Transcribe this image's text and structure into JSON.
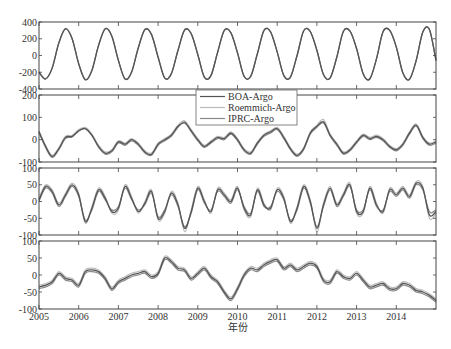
{
  "chart_data": [
    {
      "type": "line",
      "panel": 1,
      "title": "",
      "xlabel": "",
      "ylabel": "",
      "ylim": [
        -400,
        400
      ],
      "yticks": [
        -400,
        -200,
        0,
        200,
        400
      ],
      "grid": false,
      "x_start": 2005.0,
      "x_step_years": 0.16667,
      "series": [
        {
          "name": "BOA-Argo",
          "values": [
            -200,
            -280,
            -150,
            150,
            320,
            200,
            -100,
            -290,
            -180,
            120,
            320,
            230,
            -60,
            -280,
            -200,
            90,
            310,
            250,
            -20,
            -270,
            -220,
            60,
            305,
            260,
            10,
            -260,
            -240,
            40,
            300,
            270,
            30,
            -250,
            -250,
            20,
            300,
            280,
            40,
            -240,
            -260,
            0,
            295,
            285,
            60,
            -230,
            -270,
            -20,
            290,
            290,
            80,
            -220,
            -280,
            -40,
            285,
            300,
            100,
            -210,
            -285,
            -60,
            280,
            310,
            -60
          ]
        },
        {
          "name": "Roemmich-Argo",
          "values": [
            -195,
            -275,
            -145,
            155,
            322,
            205,
            -95,
            -287,
            -175,
            125,
            322,
            235,
            -55,
            -277,
            -195,
            95,
            312,
            254,
            -15,
            -267,
            -215,
            65,
            307,
            264,
            15,
            -257,
            -235,
            45,
            302,
            274,
            35,
            -247,
            -245,
            25,
            302,
            284,
            45,
            -237,
            -255,
            5,
            297,
            289,
            65,
            -227,
            -265,
            -15,
            292,
            294,
            85,
            -217,
            -275,
            -35,
            287,
            304,
            105,
            -207,
            -280,
            -55,
            282,
            314,
            -55
          ]
        },
        {
          "name": "IPRC-Argo",
          "values": [
            -198,
            -278,
            -148,
            152,
            318,
            202,
            -98,
            -288,
            -178,
            122,
            318,
            232,
            -58,
            -278,
            -198,
            92,
            308,
            252,
            -18,
            -268,
            -218,
            62,
            303,
            262,
            12,
            -258,
            -238,
            42,
            298,
            272,
            32,
            -248,
            -248,
            22,
            298,
            282,
            42,
            -238,
            -258,
            2,
            293,
            287,
            62,
            -228,
            -268,
            -18,
            288,
            292,
            82,
            -218,
            -278,
            -38,
            283,
            302,
            102,
            -208,
            -283,
            -58,
            278,
            312,
            -58
          ]
        }
      ],
      "legend": {
        "position": "upper center (overlapping panel 1/2 boundary)",
        "entries": [
          "BOA-Argo",
          "Roemmich-Argo",
          "IPRC-Argo"
        ]
      }
    },
    {
      "type": "line",
      "panel": 2,
      "ylim": [
        -100,
        200
      ],
      "yticks": [
        -100,
        0,
        100,
        200
      ],
      "x_start": 2005.0,
      "x_step_years": 0.16667,
      "series": [
        {
          "name": "BOA-Argo",
          "values": [
            35,
            -30,
            -75,
            -40,
            10,
            15,
            40,
            50,
            20,
            -30,
            -60,
            -50,
            -10,
            -20,
            0,
            -20,
            -55,
            -65,
            -20,
            0,
            20,
            60,
            75,
            40,
            0,
            -30,
            -10,
            10,
            5,
            30,
            0,
            -45,
            -60,
            -15,
            20,
            35,
            50,
            10,
            -40,
            -70,
            -40,
            30,
            60,
            80,
            20,
            -20,
            -60,
            -45,
            -10,
            20,
            5,
            15,
            0,
            -30,
            -45,
            -20,
            30,
            65,
            10,
            -20,
            -10
          ]
        },
        {
          "name": "Roemmich-Argo",
          "values": [
            40,
            -25,
            -70,
            -35,
            15,
            20,
            45,
            55,
            25,
            -25,
            -55,
            -45,
            -5,
            -15,
            5,
            -15,
            -50,
            -60,
            -15,
            5,
            25,
            65,
            85,
            45,
            5,
            -25,
            -5,
            15,
            10,
            35,
            5,
            -40,
            -55,
            -10,
            25,
            40,
            55,
            15,
            -35,
            -65,
            -35,
            35,
            65,
            90,
            25,
            -15,
            -55,
            -40,
            -5,
            25,
            10,
            20,
            5,
            -25,
            -40,
            -15,
            35,
            70,
            15,
            -15,
            -5
          ]
        },
        {
          "name": "IPRC-Argo",
          "values": [
            32,
            -35,
            -80,
            -45,
            5,
            12,
            38,
            48,
            18,
            -35,
            -65,
            -55,
            -15,
            -25,
            -5,
            -25,
            -60,
            -70,
            -25,
            -5,
            15,
            55,
            80,
            35,
            -5,
            -35,
            -15,
            5,
            0,
            25,
            -5,
            -50,
            -65,
            -20,
            15,
            30,
            45,
            5,
            -45,
            -75,
            -45,
            25,
            55,
            75,
            15,
            -25,
            -65,
            -50,
            -15,
            15,
            0,
            10,
            -5,
            -35,
            -50,
            -25,
            25,
            60,
            5,
            -25,
            -15
          ]
        }
      ]
    },
    {
      "type": "line",
      "panel": 3,
      "ylim": [
        -100,
        100
      ],
      "yticks": [
        -100,
        -50,
        0,
        50,
        100
      ],
      "x_start": 2005.0,
      "x_step_years": 0.16667,
      "series": [
        {
          "name": "BOA-Argo",
          "values": [
            5,
            45,
            30,
            -10,
            20,
            50,
            20,
            -60,
            -20,
            35,
            10,
            -30,
            -20,
            45,
            10,
            -30,
            -5,
            30,
            -50,
            -30,
            25,
            -10,
            -80,
            -30,
            40,
            0,
            -30,
            35,
            20,
            0,
            40,
            -20,
            -40,
            35,
            -10,
            -20,
            35,
            10,
            -60,
            -20,
            45,
            0,
            -80,
            -10,
            40,
            -10,
            20,
            50,
            -30,
            -30,
            40,
            -10,
            -30,
            35,
            20,
            40,
            15,
            55,
            40,
            -40,
            -30
          ]
        },
        {
          "name": "Roemmich-Argo",
          "values": [
            10,
            50,
            35,
            -5,
            25,
            55,
            25,
            -65,
            -15,
            40,
            15,
            -35,
            -25,
            50,
            15,
            -35,
            0,
            35,
            -55,
            -35,
            30,
            -5,
            -90,
            -25,
            45,
            5,
            -35,
            40,
            25,
            5,
            45,
            -25,
            -45,
            40,
            -5,
            -25,
            40,
            15,
            -65,
            -15,
            50,
            5,
            -90,
            -5,
            45,
            -5,
            25,
            55,
            -35,
            -35,
            45,
            -5,
            -35,
            40,
            25,
            45,
            20,
            60,
            45,
            -50,
            -35
          ]
        },
        {
          "name": "IPRC-Argo",
          "values": [
            0,
            40,
            25,
            -15,
            15,
            45,
            15,
            -55,
            -25,
            30,
            5,
            -25,
            -15,
            40,
            5,
            -25,
            -10,
            25,
            -45,
            -25,
            20,
            -15,
            -75,
            -35,
            35,
            -5,
            -25,
            30,
            15,
            -5,
            35,
            -15,
            -35,
            30,
            -15,
            -15,
            30,
            5,
            -55,
            -25,
            40,
            -5,
            -75,
            -15,
            35,
            -15,
            15,
            45,
            -25,
            -25,
            35,
            -15,
            -25,
            30,
            15,
            35,
            10,
            50,
            35,
            -30,
            -25
          ]
        }
      ]
    },
    {
      "type": "line",
      "panel": 4,
      "ylim": [
        -100,
        100
      ],
      "yticks": [
        -100,
        -50,
        0,
        50,
        100
      ],
      "x_start": 2005.0,
      "x_step_years": 0.16667,
      "series": [
        {
          "name": "BOA-Argo",
          "values": [
            -35,
            -30,
            -20,
            5,
            -10,
            -15,
            -30,
            10,
            15,
            10,
            -10,
            -40,
            -20,
            -10,
            0,
            5,
            10,
            -5,
            5,
            50,
            40,
            20,
            15,
            -10,
            5,
            20,
            -5,
            -20,
            -50,
            -70,
            -40,
            0,
            20,
            15,
            30,
            40,
            45,
            20,
            30,
            15,
            25,
            35,
            25,
            -15,
            -20,
            10,
            -5,
            -10,
            5,
            -15,
            -35,
            -30,
            -25,
            -40,
            -40,
            -25,
            -30,
            -45,
            -50,
            -60,
            -75
          ]
        },
        {
          "name": "Roemmich-Argo",
          "values": [
            -30,
            -25,
            -15,
            10,
            -5,
            -10,
            -25,
            15,
            20,
            15,
            -5,
            -35,
            -15,
            -5,
            5,
            10,
            15,
            0,
            10,
            55,
            45,
            25,
            20,
            -5,
            10,
            25,
            0,
            -15,
            -45,
            -65,
            -35,
            5,
            25,
            20,
            35,
            45,
            50,
            25,
            35,
            20,
            30,
            40,
            30,
            -10,
            -15,
            15,
            0,
            -5,
            10,
            -10,
            -30,
            -25,
            -20,
            -35,
            -35,
            -20,
            -25,
            -40,
            -45,
            -55,
            -70
          ]
        },
        {
          "name": "IPRC-Argo",
          "values": [
            -40,
            -35,
            -25,
            0,
            -15,
            -20,
            -35,
            5,
            10,
            5,
            -15,
            -45,
            -25,
            -15,
            -5,
            0,
            5,
            -10,
            0,
            45,
            35,
            15,
            10,
            -15,
            0,
            15,
            -10,
            -25,
            -55,
            -75,
            -45,
            -5,
            15,
            10,
            25,
            35,
            40,
            15,
            25,
            10,
            20,
            30,
            20,
            -20,
            -25,
            5,
            -10,
            -15,
            0,
            -20,
            -40,
            -35,
            -30,
            -45,
            -45,
            -30,
            -35,
            -50,
            -55,
            -65,
            -80
          ]
        }
      ]
    }
  ],
  "x_axis": {
    "label": "年份",
    "ticks": [
      "2005",
      "2006",
      "2007",
      "2008",
      "2009",
      "2010",
      "2011",
      "2012",
      "2013",
      "2014"
    ],
    "range": [
      2005,
      2015
    ]
  },
  "legend": {
    "entries": [
      {
        "label": "BOA-Argo",
        "color": "#555555"
      },
      {
        "label": "Roemmich-Argo",
        "color": "#bbbbbb"
      },
      {
        "label": "IPRC-Argo",
        "color": "#888888"
      }
    ]
  },
  "colors": {
    "BOA-Argo": "#555555",
    "Roemmich-Argo": "#bdbdbd",
    "IPRC-Argo": "#888888",
    "axis": "#444444"
  }
}
